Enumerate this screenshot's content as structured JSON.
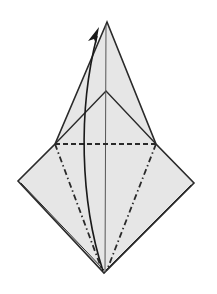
{
  "diagram": {
    "type": "origami-fold-step",
    "colors": {
      "paper": "#e6e6e6",
      "line": "#2a2a2a",
      "background": "#ffffff"
    },
    "points": {
      "top_apex": [
        107,
        22
      ],
      "inner_apex": [
        106,
        91
      ],
      "left_corner": [
        18,
        181
      ],
      "right_corner": [
        194,
        183
      ],
      "bottom_apex": [
        104,
        273
      ],
      "valley_left": [
        55,
        144
      ],
      "valley_right": [
        156,
        144
      ]
    },
    "legend": {
      "valley_fold": "dashed line",
      "mountain_fold": "dash-dot line",
      "arrow": "fold direction up"
    }
  }
}
